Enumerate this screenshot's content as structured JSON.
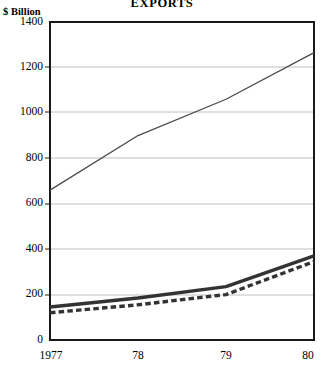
{
  "chart_data": {
    "type": "line",
    "title": "EXPORTS",
    "ylabel": "$ Billion",
    "xlabel": "",
    "categories": [
      "1977",
      "78",
      "79",
      "80"
    ],
    "x_tick_labels": [
      "1977",
      "78",
      "79",
      "80"
    ],
    "y_tick_labels": [
      "0",
      "200",
      "400",
      "600",
      "800",
      "1000",
      "1200",
      "1400"
    ],
    "y_ticks": [
      0,
      200,
      400,
      600,
      800,
      1000,
      1200,
      1400
    ],
    "ylim": [
      0,
      1400
    ],
    "grid": true,
    "grid_axis": "y",
    "legend": false,
    "legend_position": "none",
    "series": [
      {
        "name": "world-exports",
        "style": "thin-solid",
        "color": "#4a4a4a",
        "width": 1,
        "values": [
          660,
          900,
          1060,
          1265
        ]
      },
      {
        "name": "exports-upper",
        "style": "thick-solid",
        "color": "#333333",
        "width": 3,
        "values": [
          145,
          185,
          235,
          370
        ]
      },
      {
        "name": "exports-lower",
        "style": "thick-dashed",
        "color": "#333333",
        "width": 3,
        "values": [
          120,
          155,
          200,
          345
        ]
      }
    ]
  },
  "colors": {
    "frame": "#1a1a1a",
    "grid": "#b9b9b9",
    "background": "#ffffff",
    "text": "#000000"
  }
}
